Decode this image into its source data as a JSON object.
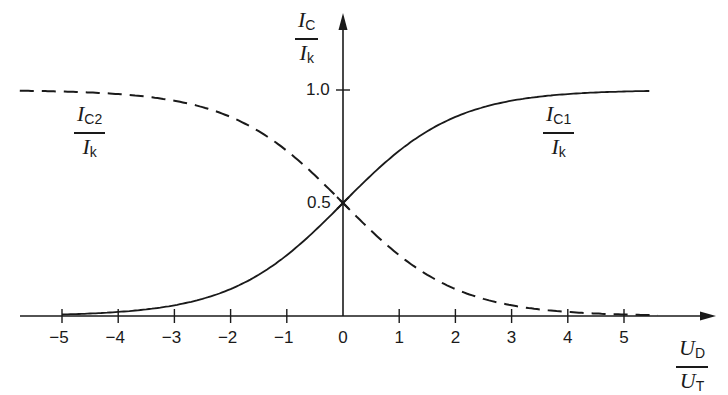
{
  "chart_data": {
    "type": "line",
    "title": "",
    "xlabel": "U_D / U_T",
    "ylabel": "I_C / I_k",
    "x_ticks": [
      -5,
      -4,
      -3,
      -2,
      -1,
      0,
      1,
      2,
      3,
      4,
      5
    ],
    "x_tick_labels": [
      "-5",
      "-4",
      "-3",
      "-2",
      "-1",
      "0",
      "1",
      "2",
      "3",
      "4",
      "5"
    ],
    "y_ticks": [
      0.5,
      1.0
    ],
    "y_tick_labels": [
      "0.5",
      "1.0"
    ],
    "xlim": [
      -6,
      6
    ],
    "ylim": [
      0,
      1.1
    ],
    "grid": false,
    "legend": "inline labels",
    "series": [
      {
        "name": "I_C1 / I_k",
        "style": "solid",
        "x": [
          -5,
          -4,
          -3,
          -2,
          -1,
          0,
          1,
          2,
          3,
          4,
          5
        ],
        "values": [
          0.007,
          0.018,
          0.047,
          0.119,
          0.269,
          0.5,
          0.731,
          0.881,
          0.953,
          0.982,
          0.993
        ]
      },
      {
        "name": "I_C2 / I_k",
        "style": "dashed",
        "x": [
          -5,
          -4,
          -3,
          -2,
          -1,
          0,
          1,
          2,
          3,
          4,
          5
        ],
        "values": [
          0.993,
          0.982,
          0.953,
          0.881,
          0.731,
          0.5,
          0.269,
          0.119,
          0.047,
          0.018,
          0.007
        ]
      }
    ],
    "annotations": [
      "intersection marked at (0, 0.5)"
    ]
  },
  "labels": {
    "y_axis": {
      "num_main": "I",
      "num_sub": "C",
      "den_main": "I",
      "den_sub": "k"
    },
    "x_axis": {
      "num_main": "U",
      "num_sub": "D",
      "den_main": "U",
      "den_sub": "T"
    },
    "curve1": {
      "num_main": "I",
      "num_sub": "C1",
      "den_main": "I",
      "den_sub": "k"
    },
    "curve2": {
      "num_main": "I",
      "num_sub": "C2",
      "den_main": "I",
      "den_sub": "k"
    },
    "y_tick_1": "1.0",
    "y_tick_05": "0.5"
  }
}
